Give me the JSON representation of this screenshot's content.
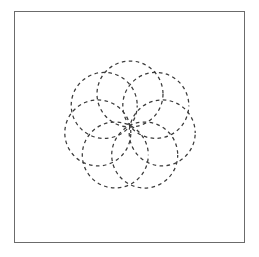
{
  "figure": {
    "background_color": "#ffffff",
    "frame": {
      "x": 14,
      "y": 11,
      "width": 231,
      "height": 232,
      "stroke_color": "#6b6b6b",
      "stroke_width": 1.5,
      "fill_color": "#ffffff"
    }
  },
  "chart_data": {
    "type": "scatter",
    "xlabel": "",
    "ylabel": "",
    "grid": false,
    "legend": false,
    "xlim": [
      14,
      245
    ],
    "ylim": [
      11,
      243
    ],
    "pattern": {
      "name": "pinwheel-rosette",
      "circle_count": 7,
      "center_x": 130,
      "center_y": 127,
      "ring_radius": 33,
      "circle_radius": 33,
      "start_angle_deg": -90,
      "pattern_bbox": [
        64,
        62,
        196,
        192
      ],
      "stroke_color": "#3b3b3b",
      "stroke_width": 1.25,
      "dash_length": 3.6,
      "gap_length": 3.4
    },
    "circles": [
      {
        "index": 1,
        "cx": 130.0,
        "cy": 94.0,
        "r": 33
      },
      {
        "index": 2,
        "cx": 155.8,
        "cy": 105.4,
        "r": 33
      },
      {
        "index": 3,
        "cx": 162.2,
        "cy": 132.9,
        "r": 33
      },
      {
        "index": 4,
        "cx": 144.7,
        "cy": 155.0,
        "r": 33
      },
      {
        "index": 5,
        "cx": 115.3,
        "cy": 155.0,
        "r": 33
      },
      {
        "index": 6,
        "cx": 97.8,
        "cy": 132.9,
        "r": 33
      },
      {
        "index": 7,
        "cx": 104.2,
        "cy": 105.4,
        "r": 33
      }
    ]
  }
}
